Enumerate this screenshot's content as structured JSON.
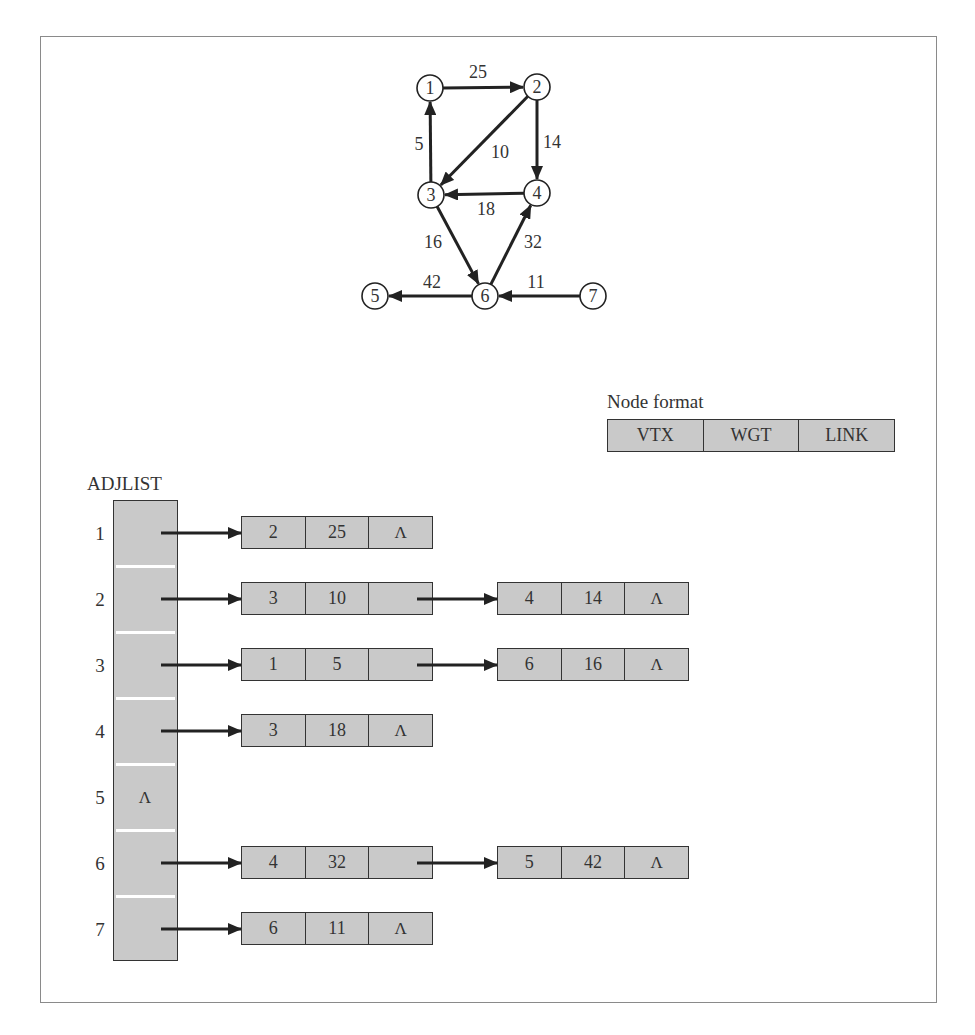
{
  "graph": {
    "nodes": [
      {
        "id": "1",
        "x": 430,
        "y": 88
      },
      {
        "id": "2",
        "x": 537,
        "y": 87
      },
      {
        "id": "3",
        "x": 431,
        "y": 195
      },
      {
        "id": "4",
        "x": 537,
        "y": 193
      },
      {
        "id": "5",
        "x": 375,
        "y": 296
      },
      {
        "id": "6",
        "x": 485,
        "y": 296
      },
      {
        "id": "7",
        "x": 593,
        "y": 296
      }
    ],
    "edges": [
      {
        "from": "1",
        "to": "2",
        "weight": "25",
        "label_x": 478,
        "label_y": 78
      },
      {
        "from": "2",
        "to": "3",
        "weight": "10",
        "label_x": 500,
        "label_y": 158
      },
      {
        "from": "2",
        "to": "4",
        "weight": "14",
        "label_x": 552,
        "label_y": 148
      },
      {
        "from": "3",
        "to": "1",
        "weight": "5",
        "label_x": 419,
        "label_y": 150
      },
      {
        "from": "4",
        "to": "3",
        "weight": "18",
        "label_x": 486,
        "label_y": 215
      },
      {
        "from": "3",
        "to": "6",
        "weight": "16",
        "label_x": 433,
        "label_y": 248
      },
      {
        "from": "6",
        "to": "4",
        "weight": "32",
        "label_x": 533,
        "label_y": 248
      },
      {
        "from": "6",
        "to": "5",
        "weight": "42",
        "label_x": 432,
        "label_y": 288
      },
      {
        "from": "7",
        "to": "6",
        "weight": "11",
        "label_x": 536,
        "label_y": 288
      }
    ]
  },
  "node_format": {
    "title": "Node format",
    "fields": [
      "VTX",
      "WGT",
      "LINK"
    ]
  },
  "adjlist": {
    "title": "ADJLIST",
    "null_symbol": "Λ",
    "rows": [
      {
        "index": "1",
        "nodes": [
          {
            "vtx": "2",
            "wgt": "25",
            "link": "Λ"
          }
        ]
      },
      {
        "index": "2",
        "nodes": [
          {
            "vtx": "3",
            "wgt": "10",
            "link": ""
          },
          {
            "vtx": "4",
            "wgt": "14",
            "link": "Λ"
          }
        ]
      },
      {
        "index": "3",
        "nodes": [
          {
            "vtx": "1",
            "wgt": "5",
            "link": ""
          },
          {
            "vtx": "6",
            "wgt": "16",
            "link": "Λ"
          }
        ]
      },
      {
        "index": "4",
        "nodes": [
          {
            "vtx": "3",
            "wgt": "18",
            "link": "Λ"
          }
        ]
      },
      {
        "index": "5",
        "head": "Λ",
        "nodes": []
      },
      {
        "index": "6",
        "nodes": [
          {
            "vtx": "4",
            "wgt": "32",
            "link": ""
          },
          {
            "vtx": "5",
            "wgt": "42",
            "link": "Λ"
          }
        ]
      },
      {
        "index": "7",
        "nodes": [
          {
            "vtx": "6",
            "wgt": "11",
            "link": "Λ"
          }
        ]
      }
    ]
  },
  "colors": {
    "cell_fill": "#c9c9c9",
    "stroke": "#222222",
    "frame": "#8a8a8a"
  }
}
